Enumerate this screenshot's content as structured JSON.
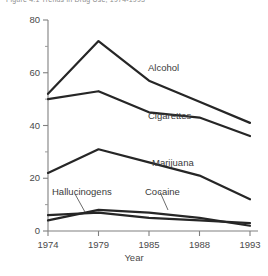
{
  "figure": {
    "caption_top": "Figure 4.1  Trends in Drug Use, 1974-1993"
  },
  "chart_data": {
    "type": "line",
    "title": "",
    "xlabel": "Year",
    "ylabel": "",
    "categories": [
      "1974",
      "1979",
      "1985",
      "1988",
      "1993"
    ],
    "x": [
      1974,
      1979,
      1985,
      1988,
      1993
    ],
    "xlim": [
      1974,
      1993
    ],
    "ylim": [
      0,
      80
    ],
    "yticks": [
      0,
      20,
      40,
      60,
      80
    ],
    "yticks_minor": [
      10,
      30,
      50,
      70
    ],
    "grid": false,
    "legend": "inline-labels",
    "line_color": "#262626",
    "series": [
      {
        "name": "Alcohol",
        "values": [
          52,
          72,
          57,
          49,
          41
        ]
      },
      {
        "name": "Cigarettes",
        "values": [
          50,
          53,
          45,
          43,
          36
        ]
      },
      {
        "name": "Marijuana",
        "values": [
          22,
          31,
          26,
          21,
          12
        ]
      },
      {
        "name": "Cocaine",
        "values": [
          4,
          8,
          7,
          5,
          2
        ]
      },
      {
        "name": "Hallucinogens",
        "values": [
          6,
          7,
          5,
          4,
          3
        ]
      }
    ]
  },
  "axis": {
    "y_tick_labels": [
      "80",
      "60",
      "40",
      "20",
      "0"
    ],
    "x_tick_labels": [
      "1974",
      "1979",
      "1985",
      "1988",
      "1993"
    ],
    "x_axis_title": "Year"
  },
  "series_labels": [
    {
      "text": "Alcohol",
      "x": 148,
      "y": 62
    },
    {
      "text": "Cigarettes",
      "x": 148,
      "y": 110
    },
    {
      "text": "Marijuana",
      "x": 152,
      "y": 157
    },
    {
      "text": "Cocaine",
      "x": 145,
      "y": 186
    },
    {
      "text": "Hallucinogens",
      "x": 52,
      "y": 186
    }
  ]
}
